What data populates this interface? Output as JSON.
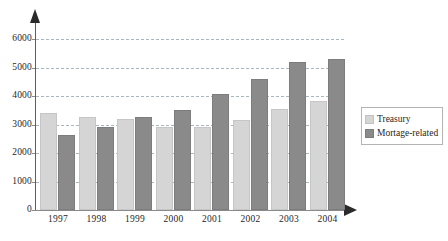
{
  "chart_data": {
    "type": "bar",
    "title": "",
    "xlabel": "",
    "ylabel": "",
    "categories": [
      "1997",
      "1998",
      "1999",
      "2000",
      "2001",
      "2002",
      "2003",
      "2004"
    ],
    "series": [
      {
        "name": "Treasury",
        "color": "#d5d5d5",
        "values": [
          3400,
          3270,
          3180,
          2930,
          2930,
          3150,
          3550,
          3820
        ]
      },
      {
        "name": "Mortage-related",
        "color": "#8a8a8a",
        "values": [
          2620,
          2900,
          3250,
          3510,
          4060,
          4600,
          5210,
          5300
        ]
      }
    ],
    "ylim": [
      0,
      6000
    ],
    "y_ticks": [
      "0",
      "1000",
      "2000",
      "3000",
      "4000",
      "5000",
      "6000"
    ],
    "y_tick_values": [
      0,
      1000,
      2000,
      3000,
      4000,
      5000,
      6000
    ],
    "grid": true,
    "grid_style": "dashed-horizontal",
    "legend_position": "right",
    "axis_arrows": true
  },
  "legend": {
    "entries": [
      {
        "label": "Treasury",
        "swatch": "treasury-swatch"
      },
      {
        "label": "Mortage-related",
        "swatch": "mortgage-swatch"
      }
    ]
  }
}
